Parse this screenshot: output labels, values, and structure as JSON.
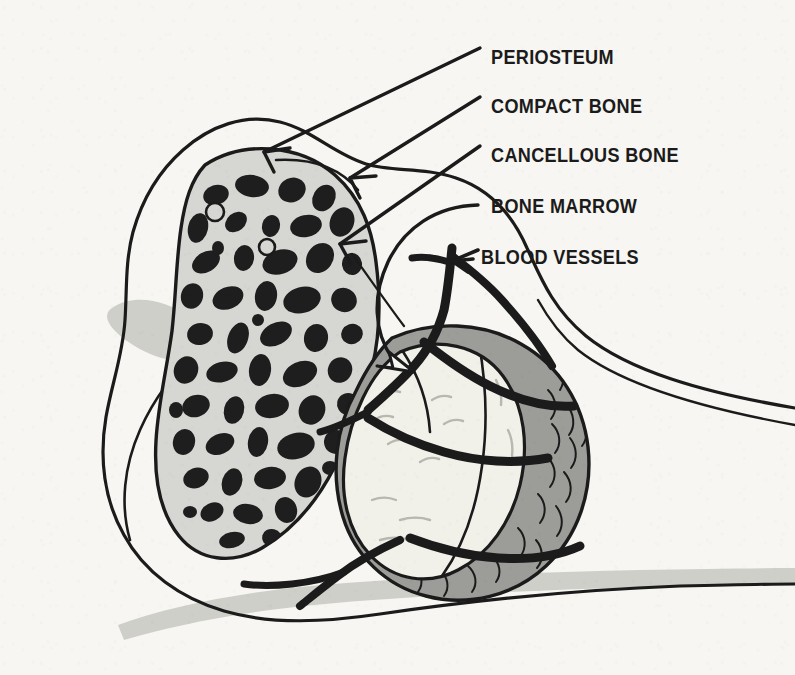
{
  "figure": {
    "background_color": "#f7f6f2",
    "ink_color": "#1b1b1b"
  },
  "palette": {
    "paper": "#f7f6f2",
    "ink": "#1b1b1b",
    "cancellous_fill": "#d6d6d2",
    "trabecula_dark": "#1e1e1e",
    "compact_bone_gray": "#9c9c99",
    "marrow_cream": "#f1f0e9",
    "shadow_gray": "#cfcfca",
    "vessel_dark": "#1b1b1b"
  },
  "labels": [
    {
      "id": "periosteum",
      "text": "PERIOSTEUM",
      "x": 491,
      "y": 46,
      "arrow": "straight",
      "target": "outer-membrane"
    },
    {
      "id": "compact-bone",
      "text": "COMPACT BONE",
      "x": 491,
      "y": 95,
      "arrow": "straight",
      "target": "dense-outer-shell"
    },
    {
      "id": "cancellous-bone",
      "text": "CANCELLOUS BONE",
      "x": 491,
      "y": 144,
      "arrow": "straight",
      "target": "spongy-trabecular-region"
    },
    {
      "id": "bone-marrow",
      "text": "BONE MARROW",
      "x": 491,
      "y": 195,
      "arrow": "curved",
      "target": "central-marrow-cavity"
    },
    {
      "id": "blood-vessels",
      "text": "BLOOD VESSELS",
      "x": 481,
      "y": 246,
      "arrow": "short",
      "target": "branching-vessel"
    }
  ],
  "regions": [
    {
      "id": "periosteum",
      "name": "Periosteum",
      "description": "Thin outer membrane line tracing the bone silhouette"
    },
    {
      "id": "compact-bone",
      "name": "Compact bone",
      "description": "Dense mid-gray cortical shell surrounding the marrow cavity"
    },
    {
      "id": "cancellous-bone",
      "name": "Cancellous bone",
      "description": "Light gray spongy region filled with dark trabeculae"
    },
    {
      "id": "bone-marrow",
      "name": "Bone marrow",
      "description": "Pale cream oval cavity at the centre of the shaft head"
    },
    {
      "id": "blood-vessels",
      "name": "Blood vessels",
      "description": "Thick dark branching vessels entering the marrow cavity"
    }
  ]
}
